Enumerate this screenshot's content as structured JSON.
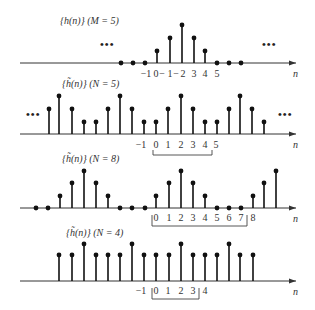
{
  "figure": {
    "axis_label": "n",
    "panels": [
      {
        "id": "h-M5",
        "title": "{h(n)}  (M = 5)",
        "axis_y": 63,
        "axis_x_start": 20,
        "axis_x_end": 296,
        "title_pos": [
          60,
          24
        ],
        "ellipsis": [
          {
            "x": 100,
            "y": 48
          },
          {
            "x": 262,
            "y": 48
          }
        ],
        "samples": [
          {
            "x": 121,
            "h": 0
          },
          {
            "x": 133,
            "h": 0
          },
          {
            "x": 145,
            "h": 0
          },
          {
            "x": 157,
            "h": 12
          },
          {
            "x": 170,
            "h": 25
          },
          {
            "x": 182,
            "h": 38
          },
          {
            "x": 194,
            "h": 25
          },
          {
            "x": 205,
            "h": 12
          },
          {
            "x": 217,
            "h": 0
          },
          {
            "x": 229,
            "h": 0
          },
          {
            "x": 241,
            "h": 0
          }
        ],
        "ticks": [
          {
            "x": 146,
            "label": "−1"
          },
          {
            "x": 156,
            "label": "0"
          },
          {
            "x": 162,
            "label": "−"
          },
          {
            "x": 170,
            "label": "1"
          },
          {
            "x": 176,
            "label": "−"
          },
          {
            "x": 183,
            "label": "2"
          },
          {
            "x": 194,
            "label": "3"
          },
          {
            "x": 205,
            "label": "4"
          },
          {
            "x": 217,
            "label": "5"
          }
        ],
        "tick_y": 77,
        "bracket": null
      },
      {
        "id": "htilde-N5",
        "title": "{h̃(n)}  (N = 5)",
        "axis_y": 134,
        "axis_x_start": 20,
        "axis_x_end": 296,
        "title_pos": [
          62,
          87
        ],
        "ellipsis": [
          {
            "x": 26,
            "y": 118
          },
          {
            "x": 278,
            "y": 118
          }
        ],
        "samples": [
          {
            "x": 49,
            "h": 25
          },
          {
            "x": 59,
            "h": 38
          },
          {
            "x": 72,
            "h": 25
          },
          {
            "x": 84,
            "h": 12
          },
          {
            "x": 96,
            "h": 12
          },
          {
            "x": 108,
            "h": 25
          },
          {
            "x": 120,
            "h": 38
          },
          {
            "x": 132,
            "h": 25
          },
          {
            "x": 144,
            "h": 12
          },
          {
            "x": 156,
            "h": 12
          },
          {
            "x": 168,
            "h": 25
          },
          {
            "x": 181,
            "h": 38
          },
          {
            "x": 193,
            "h": 25
          },
          {
            "x": 205,
            "h": 12
          },
          {
            "x": 217,
            "h": 12
          },
          {
            "x": 229,
            "h": 25
          },
          {
            "x": 240,
            "h": 38
          },
          {
            "x": 252,
            "h": 25
          },
          {
            "x": 264,
            "h": 12
          }
        ],
        "ticks": [
          {
            "x": 141,
            "label": "−1"
          },
          {
            "x": 156,
            "label": "0"
          },
          {
            "x": 168,
            "label": "1"
          },
          {
            "x": 181,
            "label": "2"
          },
          {
            "x": 193,
            "label": "3"
          },
          {
            "x": 205,
            "label": "4"
          },
          {
            "x": 216,
            "label": "5"
          }
        ],
        "tick_y": 148,
        "bracket": {
          "x1": 153,
          "x2": 212,
          "y_top": 150,
          "y_bottom": 155
        }
      },
      {
        "id": "htilde-N8",
        "title": "{h̃(n)}  (N = 8)",
        "axis_y": 208,
        "axis_x_start": 20,
        "axis_x_end": 296,
        "title_pos": [
          62,
          162
        ],
        "ellipsis": [],
        "samples": [
          {
            "x": 36,
            "h": 0
          },
          {
            "x": 48,
            "h": 0
          },
          {
            "x": 60,
            "h": 12
          },
          {
            "x": 72,
            "h": 25
          },
          {
            "x": 84,
            "h": 37
          },
          {
            "x": 96,
            "h": 25
          },
          {
            "x": 108,
            "h": 12
          },
          {
            "x": 120,
            "h": 0
          },
          {
            "x": 132,
            "h": 0
          },
          {
            "x": 145,
            "h": 0
          },
          {
            "x": 156,
            "h": 12
          },
          {
            "x": 169,
            "h": 25
          },
          {
            "x": 181,
            "h": 37
          },
          {
            "x": 193,
            "h": 25
          },
          {
            "x": 205,
            "h": 12
          },
          {
            "x": 217,
            "h": 0
          },
          {
            "x": 229,
            "h": 0
          },
          {
            "x": 241,
            "h": 0
          },
          {
            "x": 253,
            "h": 12
          },
          {
            "x": 264,
            "h": 25
          },
          {
            "x": 276,
            "h": 37
          }
        ],
        "ticks": [
          {
            "x": 156,
            "label": "0"
          },
          {
            "x": 169,
            "label": "1"
          },
          {
            "x": 181,
            "label": "2"
          },
          {
            "x": 193,
            "label": "3"
          },
          {
            "x": 205,
            "label": "4"
          },
          {
            "x": 217,
            "label": "5"
          },
          {
            "x": 229,
            "label": "6"
          },
          {
            "x": 241,
            "label": "7"
          },
          {
            "x": 253,
            "label": "8"
          }
        ],
        "tick_y": 221,
        "bracket": {
          "x1": 152,
          "x2": 247,
          "y_top": 215,
          "y_bottom": 226
        }
      },
      {
        "id": "htilde-N4",
        "title": "{h̃(n)}  (N = 4)",
        "axis_y": 281,
        "axis_x_start": 20,
        "axis_x_end": 296,
        "title_pos": [
          66,
          236
        ],
        "ellipsis": [],
        "samples": [
          {
            "x": 59,
            "h": 26
          },
          {
            "x": 72,
            "h": 26
          },
          {
            "x": 84,
            "h": 37
          },
          {
            "x": 96,
            "h": 26
          },
          {
            "x": 108,
            "h": 26
          },
          {
            "x": 120,
            "h": 26
          },
          {
            "x": 132,
            "h": 37
          },
          {
            "x": 144,
            "h": 26
          },
          {
            "x": 156,
            "h": 26
          },
          {
            "x": 169,
            "h": 26
          },
          {
            "x": 181,
            "h": 37
          },
          {
            "x": 193,
            "h": 26
          },
          {
            "x": 205,
            "h": 26
          },
          {
            "x": 217,
            "h": 26
          },
          {
            "x": 229,
            "h": 37
          },
          {
            "x": 240,
            "h": 26
          },
          {
            "x": 253,
            "h": 26
          }
        ],
        "ticks": [
          {
            "x": 141,
            "label": "−1"
          },
          {
            "x": 156,
            "label": "0"
          },
          {
            "x": 168,
            "label": "1"
          },
          {
            "x": 181,
            "label": "2"
          },
          {
            "x": 193,
            "label": "3"
          },
          {
            "x": 205,
            "label": "4"
          }
        ],
        "tick_y": 294,
        "bracket": {
          "x1": 152,
          "x2": 199,
          "y_top": 288,
          "y_bottom": 299
        }
      }
    ]
  }
}
